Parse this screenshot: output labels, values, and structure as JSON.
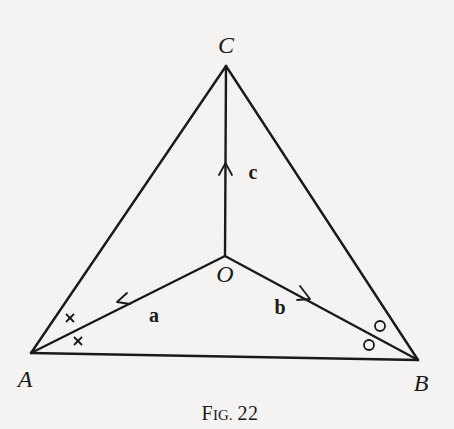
{
  "figure": {
    "caption_prefix_big": "F",
    "caption_prefix_small": "IG.",
    "caption_number": "22"
  },
  "points": {
    "A": {
      "label": "A",
      "x": 31,
      "y": 353
    },
    "B": {
      "label": "B",
      "x": 418,
      "y": 360
    },
    "C": {
      "label": "C",
      "x": 226,
      "y": 66
    },
    "O": {
      "label": "O",
      "x": 225,
      "y": 256
    }
  },
  "vectors": {
    "a": {
      "label": "a",
      "from": "O",
      "to": "A"
    },
    "b": {
      "label": "b",
      "from": "O",
      "to": "B"
    },
    "c": {
      "label": "c",
      "from": "O",
      "to": "C"
    }
  },
  "angle_marks": {
    "at_A": {
      "symbol": "×",
      "count": 2
    },
    "at_B": {
      "symbol": "○",
      "count": 2
    }
  }
}
